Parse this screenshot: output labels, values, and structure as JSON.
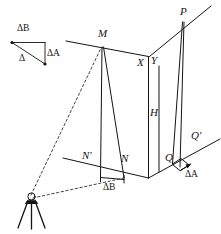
{
  "figure": {
    "stroke_color": "#141414",
    "background_color": "#ffffff",
    "labels": {
      "vertex_m": "M",
      "vertex_n": "N",
      "vertex_n_prime": "N'",
      "vertex_p": "P",
      "vertex_q": "Q",
      "vertex_q_prime": "Q'",
      "vertex_x": "X",
      "vertex_y": "Y",
      "height_h": "H",
      "delta_a_triangle": "ΔA",
      "delta_b_triangle": "ΔB",
      "delta_resultant": "Δ",
      "delta_b_base": "ΔB",
      "delta_a_base": "ΔA"
    },
    "elements": {
      "instrument": "theodolite-tripod",
      "wall_left_face": "building-left-facade",
      "wall_right_face": "building-right-facade",
      "sight_lines": "dashed-sight-lines",
      "vector_triangle": "error-vector-triangle"
    }
  }
}
